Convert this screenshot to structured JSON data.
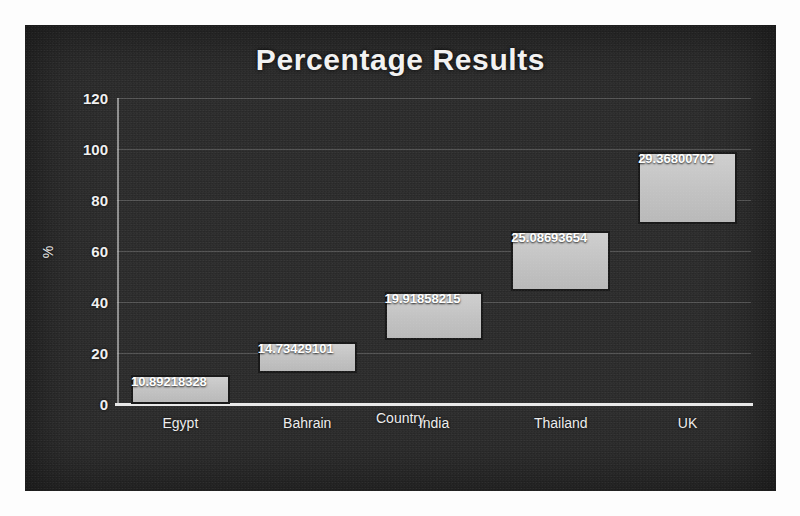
{
  "chart_data": {
    "type": "bar",
    "title": "Percentage Results",
    "xlabel": "Country",
    "ylabel": "%",
    "ylim": [
      0,
      120
    ],
    "ytick_values": [
      0,
      20,
      40,
      60,
      80,
      100,
      120
    ],
    "ytick_labels": [
      "0",
      "20",
      "40",
      "60",
      "80",
      "100",
      "120"
    ],
    "grid": true,
    "legend": "none",
    "stacked_floating": true,
    "categories": [
      "Egypt",
      "Bahrain",
      "India",
      "Thailand",
      "UK"
    ],
    "values": [
      10.89218328,
      14.73429101,
      19.91858215,
      25.08693654,
      29.36800702
    ],
    "data_labels": [
      "10.89218328",
      "14.73429101",
      "19.91858215",
      "25.08693654",
      "29.36800702"
    ],
    "bar_bases": [
      0,
      12.2,
      25.1,
      44.3,
      70.6
    ],
    "bar_tops": [
      11.4,
      24.2,
      44.1,
      67.9,
      98.8
    ],
    "series": [
      {
        "name": "invisible base",
        "visible": false,
        "values": [
          0,
          12.2,
          25.1,
          44.3,
          70.6
        ]
      },
      {
        "name": "value",
        "visible": true,
        "values": [
          11.4,
          12.0,
          19.0,
          23.5,
          28.2
        ]
      }
    ],
    "colors": {
      "bar_fill": "#c6c6c6",
      "bar_border": "#1a1a1a",
      "background": "#2b2b2b",
      "text": "#f2f2f2",
      "gridline": "#e1e1e1"
    }
  }
}
